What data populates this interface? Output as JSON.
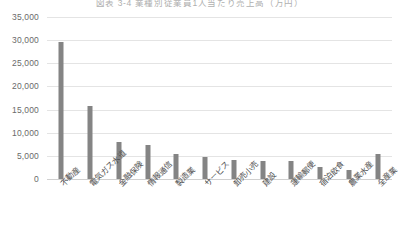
{
  "chart_data": {
    "type": "bar",
    "title": "図表 3-4  業種別従業員1人当たり売上高（万円）",
    "xlabel": "",
    "ylabel": "",
    "ylim": [
      0,
      35000
    ],
    "ytick_labels": [
      "35,000",
      "30,000",
      "25,000",
      "20,000",
      "15,000",
      "10,000",
      "5,000",
      "0"
    ],
    "ytick_values": [
      35000,
      30000,
      25000,
      20000,
      15000,
      10000,
      5000,
      0
    ],
    "ytick_interval": 5000,
    "grid": true,
    "legend": false,
    "legend_position": "none",
    "categories": [
      "不動産",
      "電気ガス水道",
      "金融保険",
      "情報通信",
      "製造業",
      "サービス",
      "卸売小売",
      "建設",
      "運輸郵便",
      "宿泊飲食",
      "農業水産",
      "全産業"
    ],
    "values": [
      29700,
      15700,
      8000,
      7400,
      5300,
      4800,
      4200,
      3900,
      3800,
      2700,
      1900,
      5300
    ],
    "series": [
      {
        "name": "従業員1人当たり売上高",
        "values": [
          29700,
          15700,
          8000,
          7400,
          5300,
          4800,
          4200,
          3900,
          3800,
          2700,
          1900,
          5300
        ]
      }
    ],
    "colors": {
      "bar": "#848484",
      "gridline": "#e4e4e4",
      "axis": "#d0d0d0",
      "tick_text": "#6a6a6a",
      "label_text": "#4d4d4d"
    }
  }
}
